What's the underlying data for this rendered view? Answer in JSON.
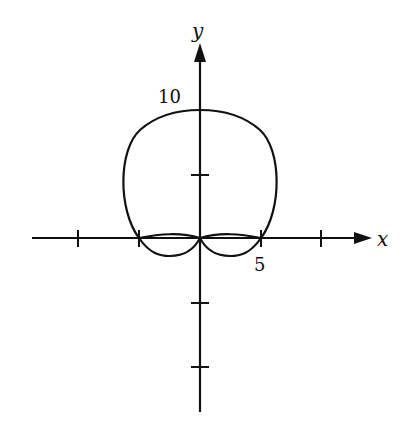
{
  "diagram": {
    "type": "polar-curve-plot",
    "axes": {
      "x_label": "x",
      "y_label": "y",
      "origin_px": [
        200,
        238
      ],
      "px_per_unit": 12.2,
      "x_ticks": [
        -10,
        -5,
        5,
        10
      ],
      "y_ticks": [
        5,
        -5,
        -10
      ],
      "labels": [
        {
          "text": "10",
          "at": "y=10"
        },
        {
          "text": "5",
          "at": "x=5"
        }
      ]
    },
    "curve": {
      "description": "Closed polar curve through (0,10), crossing x-axis at ±5, with two small loops below the x-axis meeting at origin",
      "color": "#111111"
    }
  },
  "text": {
    "x_axis_label": "x",
    "y_axis_label": "y",
    "label_10": "10",
    "label_5": "5"
  }
}
